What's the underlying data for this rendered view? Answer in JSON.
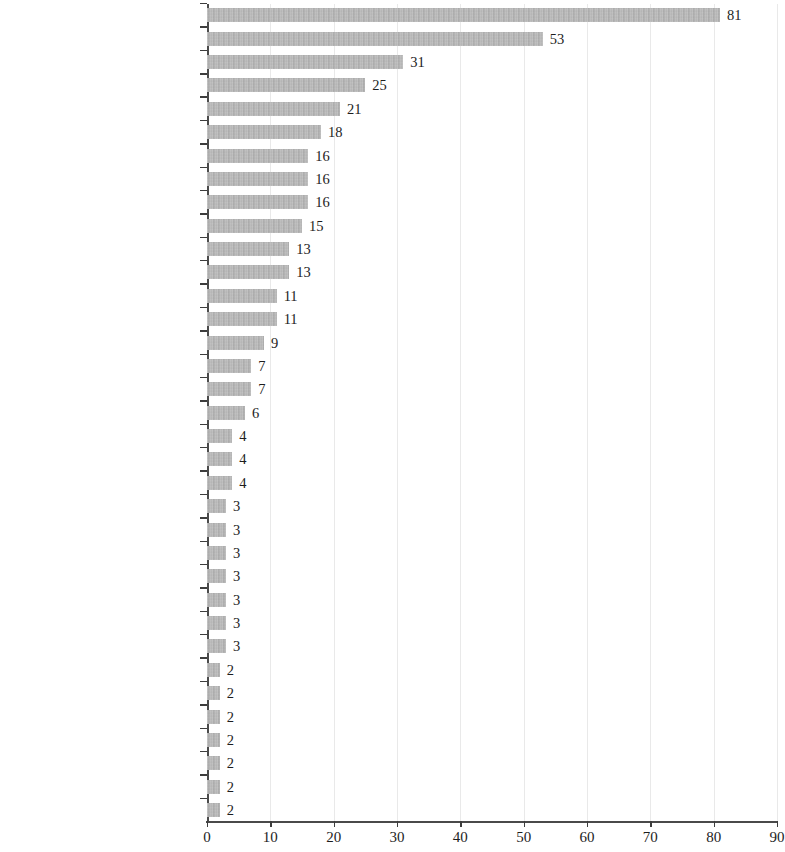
{
  "chart_data": {
    "type": "bar",
    "orientation": "horizontal",
    "title": "",
    "subtitle": "",
    "xlabel": "",
    "ylabel": "",
    "xlim": [
      0,
      90
    ],
    "xticks": [
      0,
      10,
      20,
      30,
      40,
      50,
      60,
      70,
      80,
      90
    ],
    "xtick_labels": [
      "0",
      "10",
      "20",
      "30",
      "40",
      "50",
      "60",
      "70",
      "80",
      "90"
    ],
    "grid": true,
    "grid_axis": "x",
    "legend": false,
    "legend_position": "none",
    "bar_color": "#b3b3b3",
    "axis_color": "#4a4a4a",
    "gridline_color": "#e9e9e9",
    "text_color": "#1d1d1d",
    "value_labels": true,
    "categories": [
      "France",
      "Germany",
      "Poland",
      "Hungary",
      "Belgium",
      "Latvia",
      "England",
      "Greece",
      "Romania",
      "Bulgaria",
      "Italy",
      "Turkey",
      "United States",
      "Serbia (since 1926 Yugoslavia)",
      "Lithuania",
      "Austria",
      "China",
      "Egypt",
      "Cyprus",
      "India",
      "Luxembourg",
      "Colombia",
      "Estonia",
      "Netherlands",
      "Portugal",
      "Scotland",
      "Spain",
      "Russia",
      "Bolivia",
      "Denmark",
      "Finland",
      "Iran",
      "Japan",
      "Norway",
      "Sweden"
    ],
    "values": [
      81,
      53,
      31,
      25,
      21,
      18,
      16,
      16,
      16,
      15,
      13,
      13,
      11,
      11,
      9,
      7,
      7,
      6,
      4,
      4,
      4,
      3,
      3,
      3,
      3,
      3,
      3,
      3,
      2,
      2,
      2,
      2,
      2,
      2,
      2
    ],
    "value_label_texts": [
      "81",
      "53",
      "31",
      "25",
      "21",
      "18",
      "16",
      "16",
      "16",
      "15",
      "13",
      "13",
      "11",
      "11",
      "9",
      "7",
      "7",
      "6",
      "4",
      "4",
      "4",
      "3",
      "3",
      "3",
      "3",
      "3",
      "3",
      "3",
      "2",
      "2",
      "2",
      "2",
      "2",
      "2",
      "2"
    ]
  }
}
